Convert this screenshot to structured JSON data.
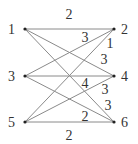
{
  "diagram": {
    "type": "bipartite-weighted-graph",
    "nodes": [
      {
        "id": "1",
        "label": "1",
        "x": 25,
        "y": 29,
        "label_x": 8,
        "label_y": 34
      },
      {
        "id": "2",
        "label": "2",
        "x": 114,
        "y": 29,
        "label_x": 121,
        "label_y": 34
      },
      {
        "id": "3",
        "label": "3",
        "x": 25,
        "y": 76,
        "label_x": 8,
        "label_y": 81
      },
      {
        "id": "4",
        "label": "4",
        "x": 114,
        "y": 76,
        "label_x": 121,
        "label_y": 81
      },
      {
        "id": "5",
        "label": "5",
        "x": 25,
        "y": 122,
        "label_x": 8,
        "label_y": 127
      },
      {
        "id": "6",
        "label": "6",
        "x": 114,
        "y": 122,
        "label_x": 121,
        "label_y": 127
      }
    ],
    "edges": [
      {
        "from": "1",
        "to": "2",
        "weight": "2"
      },
      {
        "from": "1",
        "to": "4",
        "weight": "3"
      },
      {
        "from": "1",
        "to": "6",
        "weight": "3"
      },
      {
        "from": "3",
        "to": "2",
        "weight": "3"
      },
      {
        "from": "3",
        "to": "4",
        "weight": "4"
      },
      {
        "from": "3",
        "to": "6",
        "weight": "3"
      },
      {
        "from": "5",
        "to": "2",
        "weight": "1"
      },
      {
        "from": "5",
        "to": "4",
        "weight": "2"
      },
      {
        "from": "5",
        "to": "6",
        "weight": "2"
      }
    ],
    "edge_labels": [
      {
        "text": "2",
        "x": 69,
        "y": 19
      },
      {
        "text": "3",
        "x": 85,
        "y": 42
      },
      {
        "text": "1",
        "x": 110,
        "y": 48
      },
      {
        "text": "3",
        "x": 104,
        "y": 64
      },
      {
        "text": "4",
        "x": 85,
        "y": 88
      },
      {
        "text": "3",
        "x": 105,
        "y": 94
      },
      {
        "text": "3",
        "x": 108,
        "y": 110
      },
      {
        "text": "2",
        "x": 85,
        "y": 121
      },
      {
        "text": "2",
        "x": 69,
        "y": 140
      }
    ],
    "colors": {
      "edge": "#8a8a8a",
      "node": "#222222",
      "text": "#333333"
    }
  }
}
